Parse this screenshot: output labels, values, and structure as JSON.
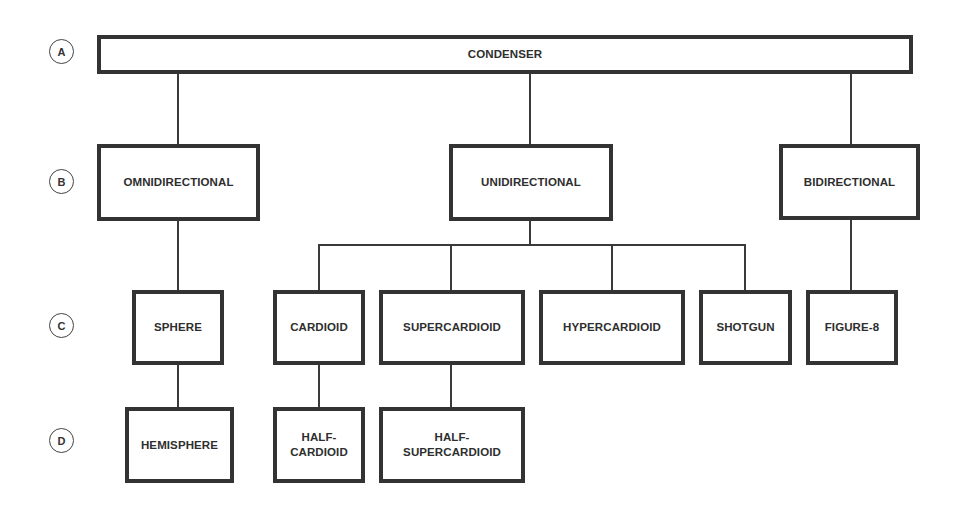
{
  "diagram": {
    "type": "tree"
  },
  "levels": [
    {
      "id": "A",
      "label": "A"
    },
    {
      "id": "B",
      "label": "B"
    },
    {
      "id": "C",
      "label": "C"
    },
    {
      "id": "D",
      "label": "D"
    }
  ],
  "nodes": {
    "condenser": {
      "label": "CONDENSER",
      "level": "A"
    },
    "omnidirectional": {
      "label": "OMNIDIRECTIONAL",
      "level": "B",
      "parent": "condenser"
    },
    "unidirectional": {
      "label": "UNIDIRECTIONAL",
      "level": "B",
      "parent": "condenser"
    },
    "bidirectional": {
      "label": "BIDIRECTIONAL",
      "level": "B",
      "parent": "condenser"
    },
    "sphere": {
      "label": "SPHERE",
      "level": "C",
      "parent": "omnidirectional"
    },
    "cardioid": {
      "label": "CARDIOID",
      "level": "C",
      "parent": "unidirectional"
    },
    "supercardioid": {
      "label": "SUPERCARDIOID",
      "level": "C",
      "parent": "unidirectional"
    },
    "hypercardioid": {
      "label": "HYPERCARDIOID",
      "level": "C",
      "parent": "unidirectional"
    },
    "shotgun": {
      "label": "SHOTGUN",
      "level": "C",
      "parent": "unidirectional"
    },
    "figure8": {
      "label": "FIGURE-8",
      "level": "C",
      "parent": "bidirectional"
    },
    "hemisphere": {
      "label": "HEMISPHERE",
      "level": "D",
      "parent": "sphere"
    },
    "half_cardioid": {
      "label": "HALF-\nCARDIOID",
      "level": "D",
      "parent": "cardioid"
    },
    "half_supercardioid": {
      "label": "HALF-\nSUPERCARDIOID",
      "level": "D",
      "parent": "supercardioid"
    }
  },
  "colors": {
    "border": "#333333",
    "line": "#3a3a3a",
    "text": "#2e2e2e",
    "background": "#ffffff"
  }
}
